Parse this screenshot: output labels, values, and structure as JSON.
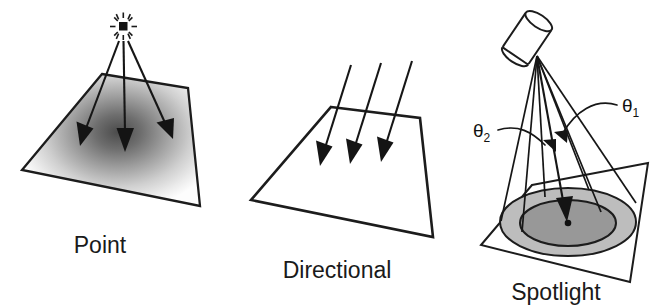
{
  "figure": {
    "background_color": "#ffffff",
    "ink_color": "#1c1c1c"
  },
  "panels": [
    {
      "id": "point",
      "caption": "Point",
      "caption_pos": {
        "x": 100,
        "y": 253
      },
      "light_icon": "point-light-burst-icon",
      "surface_fill": "radial-gradient-gray",
      "surface_quad": "102,74 188,88 200,206 22,170",
      "source": {
        "x": 123,
        "y": 26
      },
      "rays": [
        {
          "from": [
            120,
            40
          ],
          "to": [
            83,
            133
          ]
        },
        {
          "from": [
            124,
            40
          ],
          "to": [
            126,
            140
          ]
        },
        {
          "from": [
            128,
            40
          ],
          "to": [
            172,
            128
          ]
        }
      ],
      "gradient": {
        "center": [
          118,
          132
        ],
        "inner_color": "#4b4b4b",
        "mid_color": "#9a9a9a",
        "outer_color": "#fdfdfd"
      }
    },
    {
      "id": "directional",
      "caption": "Directional",
      "caption_pos": {
        "x": 258,
        "y": 278
      },
      "light_icon": "parallel-rays-icon",
      "surface_fill": "#d2d2d2",
      "surface_quad": "331,107 420,118 433,237 251,200",
      "rays": [
        {
          "from": [
            348,
            66
          ],
          "to": [
            322,
            152
          ]
        },
        {
          "from": [
            378,
            63
          ],
          "to": [
            352,
            150
          ]
        },
        {
          "from": [
            409,
            62
          ],
          "to": [
            382,
            148
          ]
        }
      ]
    },
    {
      "id": "spotlight",
      "caption": "Spotlight",
      "caption_pos": {
        "x": 492,
        "y": 300
      },
      "light_icon": "spotlight-cylinder-icon",
      "surface_fill": "none",
      "surface_quad": "532,185 648,163 630,282 481,245",
      "apex": {
        "x": 537,
        "y": 56
      },
      "cylinder": {
        "top_center": [
          521,
          24
        ],
        "angle_deg": 35,
        "fill": "#ffffff"
      },
      "outer_ellipse": {
        "cx": 568,
        "cy": 222,
        "rx": 68,
        "ry": 34,
        "fill": "#bdbdbd",
        "label": "umbra-outer-cone-footprint"
      },
      "inner_ellipse": {
        "cx": 568,
        "cy": 223,
        "rx": 48,
        "ry": 23,
        "fill": "#979797",
        "label": "inner-cone-footprint"
      },
      "center_dot": {
        "cx": 568,
        "cy": 223,
        "r": 3.2
      },
      "cone_rays": [
        {
          "from": [
            537,
            56
          ],
          "to": [
            500,
            222
          ]
        },
        {
          "from": [
            537,
            56
          ],
          "to": [
            521,
            230
          ]
        },
        {
          "from": [
            537,
            56
          ],
          "to": [
            566,
            226
          ]
        },
        {
          "from": [
            537,
            56
          ],
          "to": [
            600,
            213
          ]
        },
        {
          "from": [
            537,
            56
          ],
          "to": [
            636,
            204
          ]
        }
      ],
      "axis_arrow": {
        "from": [
          537,
          56
        ],
        "to": [
          566,
          216
        ]
      },
      "annotations": [
        {
          "id": "theta-2",
          "symbol": "θ",
          "subscript": "2",
          "text_pos": {
            "x": 474,
            "y": 136
          },
          "arc": "M 498 129 C 520 124, 534 131, 548 142",
          "target": [
            552,
            146
          ]
        },
        {
          "id": "theta-1",
          "symbol": "θ",
          "subscript": "1",
          "text_pos": {
            "x": 623,
            "y": 112
          },
          "arc": "M 618 108 C 596 100, 576 112, 566 132",
          "target": [
            564,
            137
          ]
        }
      ]
    }
  ]
}
